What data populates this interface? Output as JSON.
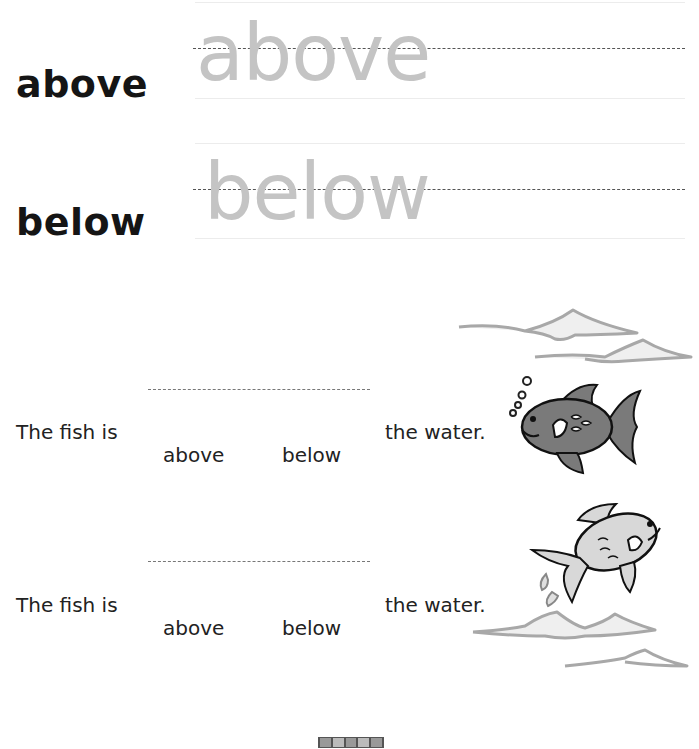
{
  "tracing": [
    {
      "label": "above",
      "trace": "above"
    },
    {
      "label": "below",
      "trace": "below"
    }
  ],
  "questions": [
    {
      "prefix": "The fish is",
      "suffix": "the water.",
      "choices": [
        "above",
        "below"
      ],
      "image": "fish-underwater-icon"
    },
    {
      "prefix": "The fish is",
      "suffix": "the water.",
      "choices": [
        "above",
        "below"
      ],
      "image": "fish-jumping-icon"
    }
  ],
  "colors": {
    "trace": "#c4c4c4",
    "wave": "#a8a8a8",
    "fish_dark": "#7a7a7a",
    "fish_light": "#d8d8d8"
  }
}
